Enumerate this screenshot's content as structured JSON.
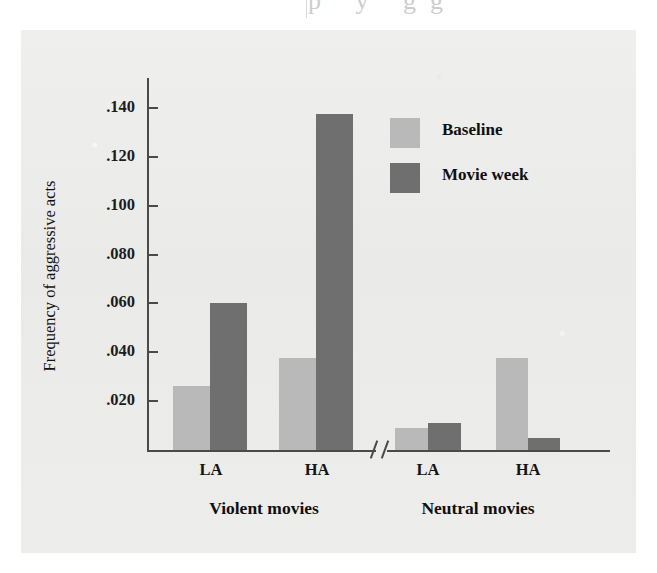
{
  "page": {
    "top_bleed_text": "p y gg",
    "background_color": "#ffffff",
    "panel_color": "#ecebea"
  },
  "chart_data": {
    "type": "bar",
    "title": "",
    "subtitle": "",
    "xlabel": "",
    "ylabel": "Frequency of aggressive acts",
    "ylim": [
      0,
      0.152
    ],
    "yticks": [
      0.02,
      0.04,
      0.06,
      0.08,
      0.1,
      0.12,
      0.14
    ],
    "ytick_labels": [
      ".020",
      ".040",
      ".060",
      ".080",
      ".100",
      ".120",
      ".140"
    ],
    "grid": false,
    "axis_break": true,
    "axis_break_note": "//",
    "legend_position": "upper-right-inside",
    "categories": [
      "LA",
      "HA",
      "LA",
      "HA"
    ],
    "groups": [
      {
        "label": "Violent movies",
        "categories": [
          "LA",
          "HA"
        ]
      },
      {
        "label": "Neutral movies",
        "categories": [
          "LA",
          "HA"
        ]
      }
    ],
    "series": [
      {
        "name": "Baseline",
        "color": "#b9b9b9",
        "values": [
          0.026,
          0.0375,
          0.009,
          0.0375
        ]
      },
      {
        "name": "Movie week",
        "color": "#6f6f6f",
        "values": [
          0.06,
          0.1375,
          0.011,
          0.005
        ]
      }
    ],
    "bars": [
      {
        "group": "Violent movies",
        "category": "LA",
        "series": "Baseline",
        "value": 0.026,
        "color": "#b9b9b9"
      },
      {
        "group": "Violent movies",
        "category": "LA",
        "series": "Movie week",
        "value": 0.06,
        "color": "#6f6f6f"
      },
      {
        "group": "Violent movies",
        "category": "HA",
        "series": "Baseline",
        "value": 0.0375,
        "color": "#b9b9b9"
      },
      {
        "group": "Violent movies",
        "category": "HA",
        "series": "Movie week",
        "value": 0.1375,
        "color": "#6f6f6f"
      },
      {
        "group": "Neutral movies",
        "category": "LA",
        "series": "Baseline",
        "value": 0.009,
        "color": "#b9b9b9"
      },
      {
        "group": "Neutral movies",
        "category": "LA",
        "series": "Movie week",
        "value": 0.011,
        "color": "#6f6f6f"
      },
      {
        "group": "Neutral movies",
        "category": "HA",
        "series": "Baseline",
        "value": 0.0375,
        "color": "#b9b9b9"
      },
      {
        "group": "Neutral movies",
        "category": "HA",
        "series": "Movie week",
        "value": 0.005,
        "color": "#6f6f6f"
      }
    ],
    "legend": [
      {
        "label": "Baseline",
        "color": "#b9b9b9"
      },
      {
        "label": "Movie week",
        "color": "#6f6f6f"
      }
    ]
  }
}
